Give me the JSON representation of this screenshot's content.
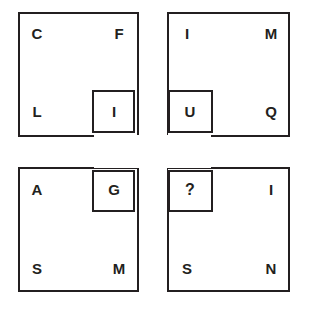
{
  "puzzle": {
    "title": "Overlapping Letter Squares Puzzle",
    "line_color": "#231f20",
    "background_color": "#ffffff",
    "missing_marker": "?",
    "outer_squares": [
      {
        "id": "top-left",
        "corners": {
          "top_left": "C",
          "top_right": "F",
          "bottom_left": "L",
          "bottom_right": "I"
        }
      },
      {
        "id": "top-right",
        "corners": {
          "top_left": "I",
          "top_right": "M",
          "bottom_left": "U",
          "bottom_right": "Q"
        }
      },
      {
        "id": "bottom-left",
        "corners": {
          "top_left": "A",
          "top_right": "G",
          "bottom_left": "S",
          "bottom_right": "M"
        }
      },
      {
        "id": "bottom-right",
        "corners": {
          "top_left": "?",
          "top_right": "I",
          "bottom_left": "S",
          "bottom_right": "N"
        }
      }
    ],
    "center_squares": [
      {
        "id": "center-top-left",
        "letter": "I"
      },
      {
        "id": "center-top-right",
        "letter": "U"
      },
      {
        "id": "center-bottom-left",
        "letter": "G"
      },
      {
        "id": "center-bottom-right",
        "letter": "?"
      }
    ]
  }
}
